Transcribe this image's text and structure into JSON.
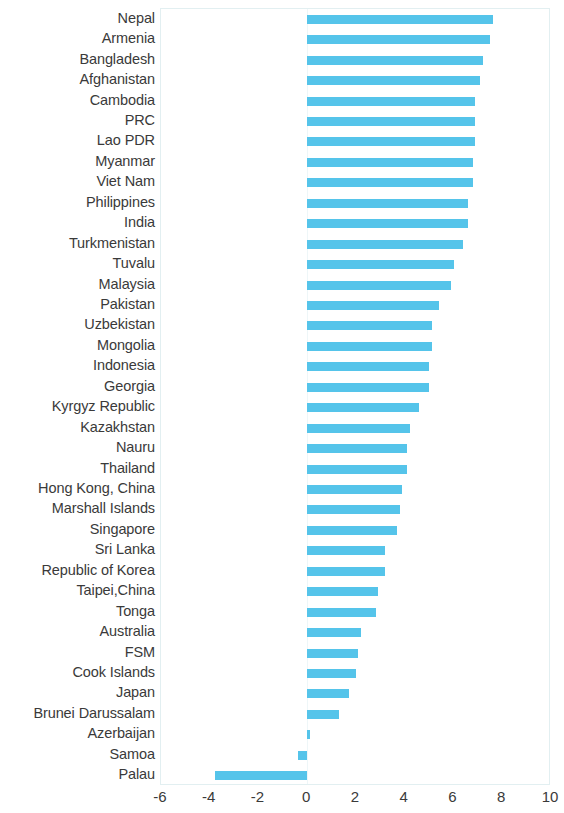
{
  "chart_data": {
    "type": "bar",
    "orientation": "horizontal",
    "title": "",
    "subtitle": "",
    "xlabel": "",
    "ylabel": "",
    "xlim": [
      -6,
      10
    ],
    "xticks": [
      -6,
      -4,
      -2,
      0,
      2,
      4,
      6,
      8,
      10
    ],
    "xtick_labels": [
      "-6",
      "-4",
      "-2",
      "0",
      "2",
      "4",
      "6",
      "8",
      "10"
    ],
    "grid": false,
    "legend": null,
    "bar_color": "#55c4ea",
    "background_color": "#ffffff",
    "axis_border_color": "#e2eff1",
    "categories": [
      "Nepal",
      "Armenia",
      "Bangladesh",
      "Afghanistan",
      "Cambodia",
      "PRC",
      "Lao PDR",
      "Myanmar",
      "Viet Nam",
      "Philippines",
      "India",
      "Turkmenistan",
      "Tuvalu",
      "Malaysia",
      "Pakistan",
      "Uzbekistan",
      "Mongolia",
      "Indonesia",
      "Georgia",
      "Kyrgyz Republic",
      "Kazakhstan",
      "Nauru",
      "Thailand",
      "Hong Kong, China",
      "Marshall Islands",
      "Singapore",
      "Sri Lanka",
      "Republic of Korea",
      "Taipei,China",
      "Tonga",
      "Australia",
      "FSM",
      "Cook Islands",
      "Japan",
      "Brunei Darussalam",
      "Azerbaijan",
      "Samoa",
      "Palau"
    ],
    "values": [
      7.6,
      7.5,
      7.2,
      7.1,
      6.9,
      6.9,
      6.9,
      6.8,
      6.8,
      6.6,
      6.6,
      6.4,
      6.0,
      5.9,
      5.4,
      5.1,
      5.1,
      5.0,
      5.0,
      4.6,
      4.2,
      4.1,
      4.1,
      3.9,
      3.8,
      3.7,
      3.2,
      3.2,
      2.9,
      2.8,
      2.2,
      2.1,
      2.0,
      1.7,
      1.3,
      0.1,
      -0.4,
      -3.8
    ]
  }
}
